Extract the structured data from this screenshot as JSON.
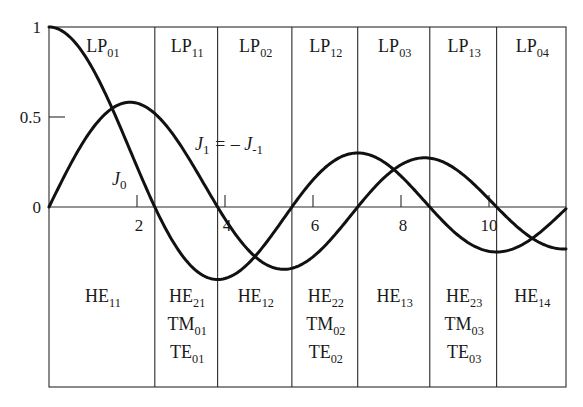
{
  "chart_data": {
    "type": "line",
    "title": "",
    "xlabel": "",
    "ylabel": "",
    "xlim": [
      0,
      11.75
    ],
    "ylim": [
      -1.0,
      1.0
    ],
    "xticks": [
      2,
      4,
      6,
      8,
      10
    ],
    "xtick_labels": [
      "2",
      "4",
      "6",
      "8",
      "10"
    ],
    "yticks": [
      0,
      0.5,
      1
    ],
    "ytick_labels": [
      "0",
      "0.5",
      "1"
    ],
    "grid": false,
    "series": [
      {
        "name": "J0",
        "label": "J",
        "label_sub": "0",
        "function": "bessel_j0",
        "order": 0
      },
      {
        "name": "J1 = -J-1",
        "label": "J",
        "label_sub": "1",
        "label_suffix": " = – J",
        "label_suffix_sub": "-1",
        "function": "bessel_j1",
        "order": 1
      }
    ],
    "dividers_x": [
      2.405,
      3.832,
      5.52,
      7.016,
      8.654,
      10.173
    ],
    "annotations": {
      "lp_modes": [
        {
          "label": "LP",
          "sub": "01"
        },
        {
          "label": "LP",
          "sub": "11"
        },
        {
          "label": "LP",
          "sub": "02"
        },
        {
          "label": "LP",
          "sub": "12"
        },
        {
          "label": "LP",
          "sub": "03"
        },
        {
          "label": "LP",
          "sub": "13"
        },
        {
          "label": "LP",
          "sub": "04"
        }
      ],
      "vector_modes": [
        [
          {
            "label": "HE",
            "sub": "11"
          }
        ],
        [
          {
            "label": "HE",
            "sub": "21"
          },
          {
            "label": "TM",
            "sub": "01"
          },
          {
            "label": "TE",
            "sub": "01"
          }
        ],
        [
          {
            "label": "HE",
            "sub": "12"
          }
        ],
        [
          {
            "label": "HE",
            "sub": "22"
          },
          {
            "label": "TM",
            "sub": "02"
          },
          {
            "label": "TE",
            "sub": "02"
          }
        ],
        [
          {
            "label": "HE",
            "sub": "13"
          }
        ],
        [
          {
            "label": "HE",
            "sub": "23"
          },
          {
            "label": "TM",
            "sub": "03"
          },
          {
            "label": "TE",
            "sub": "03"
          }
        ],
        [
          {
            "label": "HE",
            "sub": "14"
          }
        ]
      ]
    },
    "colors": {
      "line": "#111111",
      "frame": "#2a2a2a",
      "text": "#1a1a1a"
    }
  }
}
